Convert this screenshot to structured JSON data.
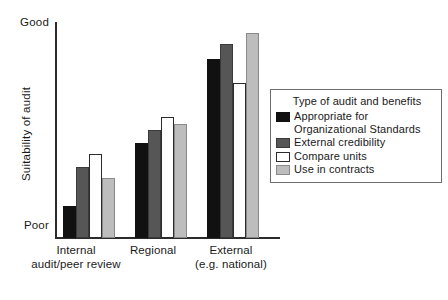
{
  "chart_data": {
    "type": "bar",
    "title": "",
    "xlabel": "",
    "ylabel": "Suitability of audit",
    "ylim": [
      0,
      1
    ],
    "y_tick_labels": [
      "Poor",
      "Good"
    ],
    "grid": false,
    "legend_position": "right",
    "legend_title": "Type of audit and benefits",
    "categories": [
      "Internal\naudit/peer review",
      "Regional",
      "External\n(e.g. national)"
    ],
    "series": [
      {
        "name": "Appropriate for\nOrganizational Standards",
        "color": "#111111",
        "values": [
          0.15,
          0.44,
          0.83
        ]
      },
      {
        "name": "External credibility",
        "color": "#565656",
        "values": [
          0.33,
          0.5,
          0.9
        ]
      },
      {
        "name": "Compare units",
        "color": "#ffffff",
        "values": [
          0.39,
          0.56,
          0.72
        ]
      },
      {
        "name": "Use in contracts",
        "color": "#bdbdbd",
        "values": [
          0.28,
          0.53,
          0.95
        ]
      }
    ]
  },
  "axis": {
    "y_top_label": "Good",
    "y_bottom_label": "Poor",
    "y_axis_title": "Suitability of audit"
  },
  "groups": [
    {
      "label": "Internal\naudit/peer review"
    },
    {
      "label": "Regional"
    },
    {
      "label": "External\n(e.g. national)"
    }
  ],
  "legend": {
    "title": "Type of audit and benefits",
    "items": [
      {
        "label": "Appropriate for\nOrganizational Standards",
        "swatch": "black-swatch"
      },
      {
        "label": "External credibility",
        "swatch": "dark-gray-swatch"
      },
      {
        "label": "Compare units",
        "swatch": "white-swatch"
      },
      {
        "label": "Use in contracts",
        "swatch": "light-gray-swatch"
      }
    ]
  }
}
